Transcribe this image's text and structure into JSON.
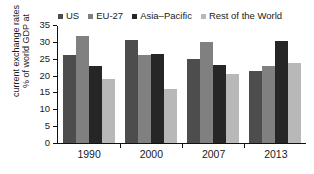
{
  "chart_data": {
    "type": "bar",
    "title": "",
    "xlabel": "",
    "ylabel": "% of world GDP at current exchange rates",
    "ylabel_lines": [
      "% of world GDP at",
      "current exchange rates"
    ],
    "categories": [
      "1990",
      "2000",
      "2007",
      "2013"
    ],
    "ylim": [
      0,
      35
    ],
    "yticks": [
      0,
      5,
      10,
      15,
      20,
      25,
      30,
      35
    ],
    "grid": false,
    "legend_position": "top",
    "series": [
      {
        "name": "US",
        "color": "#4d4d4d",
        "values": [
          26.0,
          30.5,
          24.8,
          21.4
        ]
      },
      {
        "name": "EU-27",
        "color": "#808080",
        "values": [
          31.6,
          26.0,
          30.0,
          22.7
        ]
      },
      {
        "name": "Asia–Pacific",
        "color": "#262626",
        "values": [
          22.8,
          26.3,
          23.2,
          30.2
        ]
      },
      {
        "name": "Rest of the World",
        "color": "#b8b8b8",
        "values": [
          19.0,
          16.0,
          20.4,
          23.8
        ]
      }
    ]
  },
  "axis": {
    "tick_labels": [
      "0",
      "5",
      "10",
      "15",
      "20",
      "25",
      "30",
      "35"
    ]
  }
}
